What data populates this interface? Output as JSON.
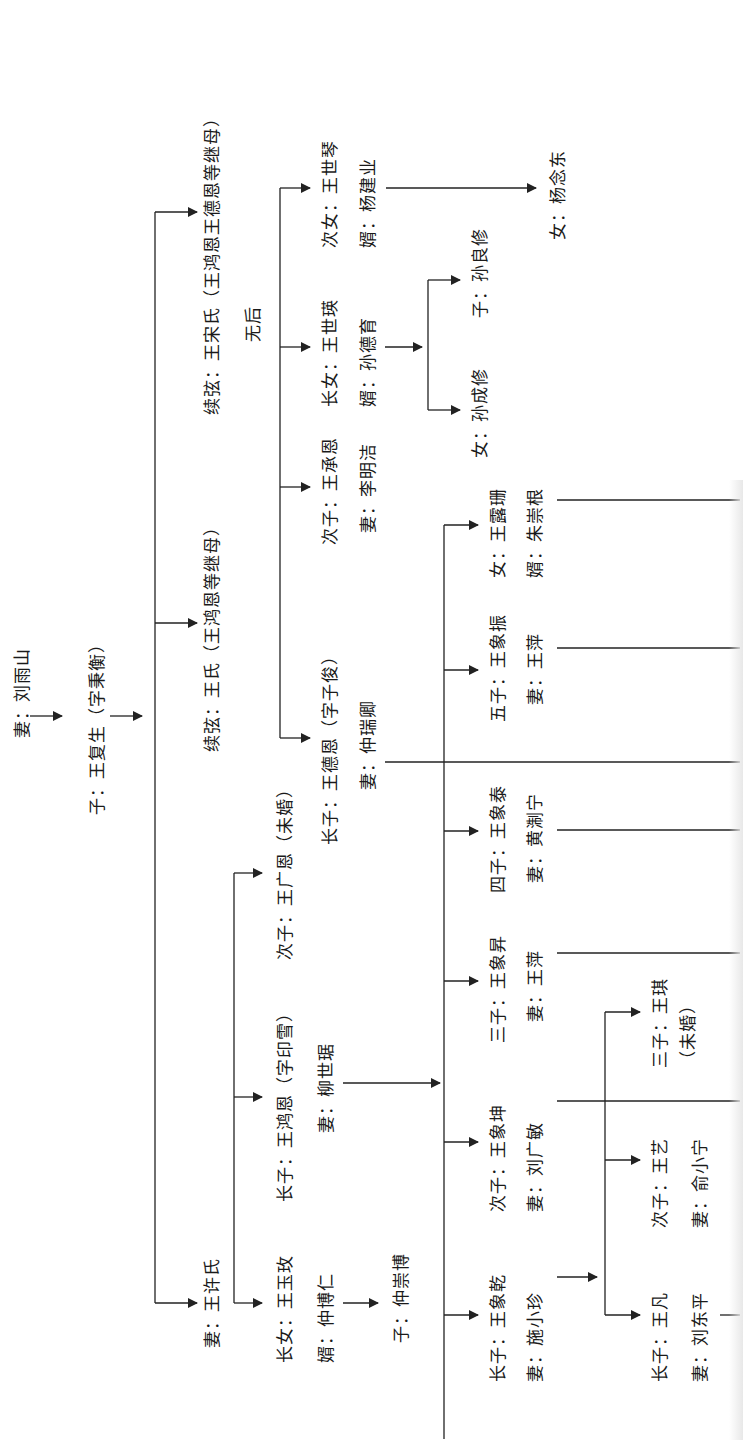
{
  "diagram": {
    "type": "family-tree",
    "orientation": "rotated-90",
    "colors": {
      "line": "#222222",
      "text": "#1a1a1a",
      "background": "#ffffff"
    }
  },
  "nodes": {
    "root_wife": "妻：刘雨山",
    "son": "子：王复生（字秉衡）",
    "wife1": "妻：王许氏",
    "wife2": "续弦：王氏（王鸿恩等继母）",
    "wife3": "续弦：王宋氏（王鸿恩王德恩等继母）",
    "wife3_note": "无后",
    "g2_daughter": "长女：王玉玫",
    "g2_daughter_husband": "婿：仲博仁",
    "g2_daughter_son": "子：仲崇博",
    "g2_son1": "长子：王鸿恩（字印雪）",
    "g2_son1_wife": "妻：柳世琚",
    "g2_son2": "次子：王广恩（未婚）",
    "w2_son1": "长子：王德恩（字子俊）",
    "w2_son1_wife": "妻：仲瑞卿",
    "w2_son2": "次子：王承恩",
    "w2_son2_wife": "妻：李明洁",
    "w2_dau1": "长女：王世瑛",
    "w2_dau1_husband": "婿：孙德育",
    "w2_dau2": "次女：王世琴",
    "w2_dau2_husband": "婿：杨建业",
    "sun_daughter": "女：孙成修",
    "sun_son": "子：孙良修",
    "yang_daughter": "女：杨念东",
    "g3_son1": "长子：王象乾",
    "g3_son1_wife": "妻：施小珍",
    "g3_son2": "次子：王象坤",
    "g3_son2_wife": "妻：刘广敏",
    "g3_son3": "三子：王象昇",
    "g3_son3_wife": "妻：王萍",
    "g3_son4": "四子：王象泰",
    "g3_son4_wife": "妻：黄淛宁",
    "g3_son5": "五子：王象振",
    "g3_son5_wife": "妻：王萍",
    "g3_daughter": "女：王露珊",
    "g3_daughter_husband": "婿：朱崇根",
    "g4_son1": "长子：王凡",
    "g4_son1_wife": "妻：刘东平",
    "g4_son2": "次子：王艺",
    "g4_son2_wife": "妻：俞小宁",
    "g4_son3": "三子：王琪",
    "g4_son3_note": "（未婚）"
  }
}
